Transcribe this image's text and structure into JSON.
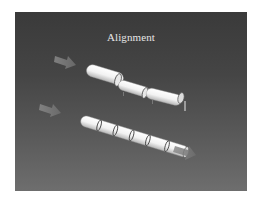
{
  "slide": {
    "title": "Alignment",
    "background_top": "#3a3a3a",
    "background_bottom": "#6e6e6e"
  },
  "diagram": {
    "top_assembly": {
      "label": "misaligned-shafts",
      "segments": 3,
      "arrow_color": "#7a7a7a"
    },
    "bottom_assembly": {
      "label": "aligned-shafts",
      "segments": 5,
      "arrow_color": "#7a7a7a"
    },
    "pipe_color": "#f4f4f4",
    "pipe_shade": "#bdbdbd",
    "joint_color": "#555555"
  }
}
